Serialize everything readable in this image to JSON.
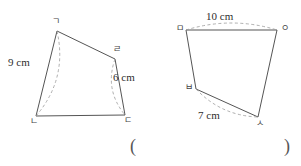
{
  "page": {
    "background_color": "#ffffff",
    "stroke_color": "#555555",
    "dash_color": "#9a9a9a"
  },
  "figures": [
    {
      "id": "figure-left",
      "name": "quadrilateral-gndr",
      "vertices": [
        {
          "label": "ㄱ",
          "x": 57,
          "y": 31,
          "label_x": 52,
          "label_y": 17
        },
        {
          "label": "ㄹ",
          "x": 115,
          "y": 59,
          "label_x": 113,
          "label_y": 45
        },
        {
          "label": "ㄷ",
          "x": 125,
          "y": 115,
          "label_x": 124,
          "label_y": 116
        },
        {
          "label": "ㄴ",
          "x": 36,
          "y": 116,
          "label_x": 30,
          "label_y": 117
        }
      ],
      "measures": [
        {
          "text": "9 cm",
          "label_x": 8,
          "label_y": 57,
          "arc": {
            "x1": 57,
            "y1": 31,
            "x2": 36,
            "y2": 116,
            "bulge": -22
          }
        },
        {
          "text": "6 cm",
          "label_x": 113,
          "label_y": 72,
          "arc": {
            "x1": 115,
            "y1": 59,
            "x2": 125,
            "y2": 115,
            "bulge": 16
          }
        }
      ]
    },
    {
      "id": "figure-right",
      "name": "quadrilateral-mbso",
      "vertices": [
        {
          "label": "ㅁ",
          "x": 186,
          "y": 30,
          "label_x": 176,
          "label_y": 24
        },
        {
          "label": "ㅇ",
          "x": 277,
          "y": 30,
          "label_x": 281,
          "label_y": 24
        },
        {
          "label": "ㅅ",
          "x": 258,
          "y": 117,
          "label_x": 256,
          "label_y": 119
        },
        {
          "label": "ㅂ",
          "x": 196,
          "y": 89,
          "label_x": 185,
          "label_y": 83
        }
      ],
      "measures": [
        {
          "text": "10 cm",
          "label_x": 206,
          "label_y": 11,
          "arc": {
            "x1": 186,
            "y1": 30,
            "x2": 277,
            "y2": 30,
            "bulge": -14
          }
        },
        {
          "text": "7 cm",
          "label_x": 198,
          "label_y": 110,
          "arc": {
            "x1": 196,
            "y1": 89,
            "x2": 258,
            "y2": 117,
            "bulge": 14
          }
        }
      ]
    }
  ],
  "answer": {
    "paren_left": "(",
    "paren_right": ")",
    "value": ""
  }
}
